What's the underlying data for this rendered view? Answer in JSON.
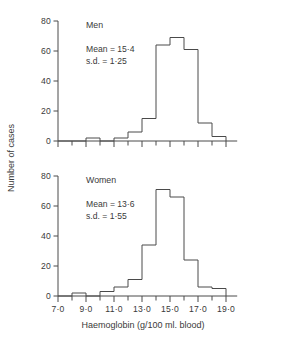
{
  "figure": {
    "y_axis_title": "Number of cases",
    "x_axis_title": "Haemoglobin (g/100 ml. blood)",
    "ink_color": "#4a4a4a",
    "background": "#ffffff"
  },
  "panels": [
    {
      "title": "Men",
      "stats": [
        "Mean = 15·4",
        "s.d. = 1·25"
      ],
      "mean_label": "Mean = 15·4",
      "sd_label": "s.d. = 1·25"
    },
    {
      "title": "Women",
      "stats": [
        "Mean = 13·6",
        "s.d. = 1·55"
      ],
      "mean_label": "Mean = 13·6",
      "sd_label": "s.d. = 1·55"
    }
  ],
  "chart_data": [
    {
      "type": "bar",
      "title": "Men",
      "subtitle": "Mean = 15·4, s.d. = 1·25",
      "xlabel": "Haemoglobin (g/100 ml. blood)",
      "ylabel": "Number of cases",
      "xlim": [
        6.5,
        19.5
      ],
      "ylim": [
        0,
        80
      ],
      "yticks": [
        0,
        20,
        40,
        60,
        80
      ],
      "ytick_labels": [
        "0",
        "20",
        "40",
        "60",
        "80"
      ],
      "xticks": [
        7,
        8,
        9,
        10,
        11,
        12,
        13,
        14,
        15,
        16,
        17,
        18,
        19
      ],
      "xtick_labels": [
        "7·0",
        "",
        "9·0",
        "",
        "11·0",
        "",
        "13·0",
        "",
        "15·0",
        "",
        "17·0",
        "",
        "19·0"
      ],
      "bin_width": 1,
      "bin_edges": [
        7,
        8,
        9,
        10,
        11,
        12,
        13,
        14,
        15,
        16,
        17,
        18,
        19
      ],
      "categories": [
        "7-8",
        "8-9",
        "9-10",
        "10-11",
        "11-12",
        "12-13",
        "13-14",
        "14-15",
        "15-16",
        "16-17",
        "17-18",
        "18-19"
      ],
      "values": [
        0,
        0,
        2,
        0,
        2,
        6,
        15,
        64,
        69,
        61,
        12,
        3
      ],
      "grid": false,
      "legend": "none",
      "mean": 15.4,
      "sd": 1.25
    },
    {
      "type": "bar",
      "title": "Women",
      "subtitle": "Mean = 13·6, s.d. = 1·55",
      "xlabel": "Haemoglobin (g/100 ml. blood)",
      "ylabel": "Number of cases",
      "xlim": [
        6.5,
        19.5
      ],
      "ylim": [
        0,
        80
      ],
      "yticks": [
        0,
        20,
        40,
        60,
        80
      ],
      "ytick_labels": [
        "0",
        "20",
        "40",
        "60",
        "80"
      ],
      "xticks": [
        7,
        8,
        9,
        10,
        11,
        12,
        13,
        14,
        15,
        16,
        17,
        18,
        19
      ],
      "xtick_labels": [
        "7·0",
        "",
        "9·0",
        "",
        "11·0",
        "",
        "13·0",
        "",
        "15·0",
        "",
        "17·0",
        "",
        "19·0"
      ],
      "bin_width": 1,
      "bin_edges": [
        7,
        8,
        9,
        10,
        11,
        12,
        13,
        14,
        15,
        16,
        17,
        18,
        19
      ],
      "categories": [
        "7-8",
        "8-9",
        "9-10",
        "10-11",
        "11-12",
        "12-13",
        "13-14",
        "14-15",
        "15-16",
        "16-17",
        "17-18",
        "18-19"
      ],
      "values": [
        0,
        2,
        0,
        3,
        6,
        11,
        34,
        71,
        66,
        24,
        6,
        5
      ],
      "grid": false,
      "legend": "none",
      "mean": 13.6,
      "sd": 1.55
    }
  ]
}
